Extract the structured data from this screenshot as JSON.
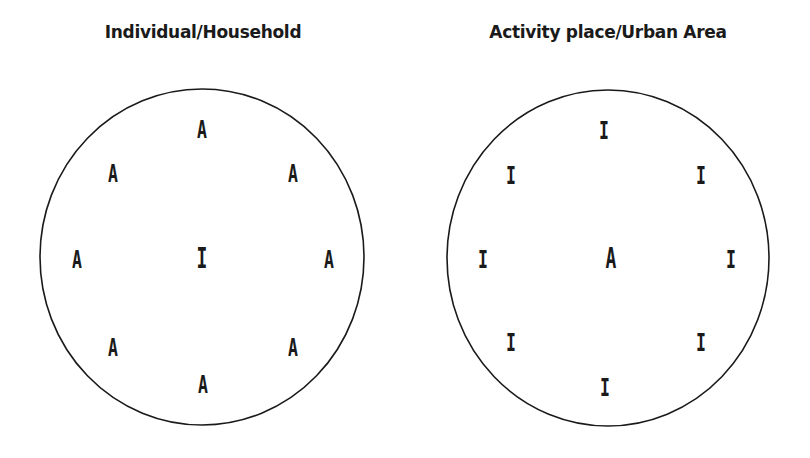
{
  "panels": [
    {
      "title": "Individual/Household",
      "title_x": 203,
      "circle": {
        "cx": 202,
        "cy": 257,
        "rx": 162,
        "ry": 168
      },
      "labels": [
        {
          "text": "A",
          "x": 202,
          "y": 138,
          "role": "outer"
        },
        {
          "text": "A",
          "x": 113,
          "y": 182,
          "role": "outer"
        },
        {
          "text": "A",
          "x": 293,
          "y": 182,
          "role": "outer"
        },
        {
          "text": "A",
          "x": 77,
          "y": 268,
          "role": "outer"
        },
        {
          "text": "I",
          "x": 202,
          "y": 268,
          "role": "center"
        },
        {
          "text": "A",
          "x": 329,
          "y": 268,
          "role": "outer"
        },
        {
          "text": "A",
          "x": 113,
          "y": 356,
          "role": "outer"
        },
        {
          "text": "A",
          "x": 293,
          "y": 356,
          "role": "outer"
        },
        {
          "text": "A",
          "x": 203,
          "y": 393,
          "role": "outer"
        }
      ]
    },
    {
      "title": "Activity place/Urban Area",
      "title_x": 608,
      "circle": {
        "cx": 608,
        "cy": 258,
        "rx": 161,
        "ry": 168
      },
      "labels": [
        {
          "text": "I",
          "x": 604,
          "y": 139,
          "role": "outer"
        },
        {
          "text": "I",
          "x": 511,
          "y": 184,
          "role": "outer"
        },
        {
          "text": "I",
          "x": 701,
          "y": 184,
          "role": "outer"
        },
        {
          "text": "I",
          "x": 483,
          "y": 268,
          "role": "outer"
        },
        {
          "text": "A",
          "x": 611,
          "y": 268,
          "role": "center"
        },
        {
          "text": "I",
          "x": 731,
          "y": 268,
          "role": "outer"
        },
        {
          "text": "I",
          "x": 511,
          "y": 351,
          "role": "outer"
        },
        {
          "text": "I",
          "x": 701,
          "y": 351,
          "role": "outer"
        },
        {
          "text": "I",
          "x": 605,
          "y": 396,
          "role": "outer"
        }
      ]
    }
  ],
  "colors": {
    "ink": "#1a1a1a",
    "background": "#ffffff"
  }
}
